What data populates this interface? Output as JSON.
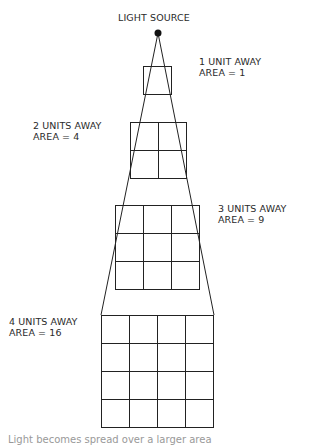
{
  "title": "LIGHT SOURCE",
  "levels": [
    {
      "distance_label": "1 UNIT AWAY",
      "area_label": "AREA = 1",
      "units": 1,
      "area": 1
    },
    {
      "distance_label": "2 UNITS AWAY",
      "area_label": "AREA = 4",
      "units": 2,
      "area": 4
    },
    {
      "distance_label": "3 UNITS AWAY",
      "area_label": "AREA = 9",
      "units": 3,
      "area": 9
    },
    {
      "distance_label": "4 UNITS AWAY",
      "area_label": "AREA = 16",
      "units": 4,
      "area": 16
    }
  ],
  "caption": "Light becomes spread over a larger area"
}
